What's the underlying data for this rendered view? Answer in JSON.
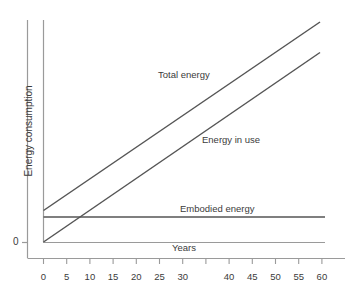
{
  "chart_data": {
    "type": "line",
    "title": "",
    "xlabel": "Years",
    "ylabel": "Energy consumption",
    "xlim": [
      0,
      60
    ],
    "ylim": [
      0,
      100
    ],
    "grid": false,
    "legend_position": "inline-annotations",
    "xticks": [
      0,
      5,
      10,
      15,
      20,
      25,
      30,
      35,
      40,
      45,
      50,
      55,
      60
    ],
    "xtick_labels": [
      "0",
      "5",
      "10",
      "15",
      "20",
      "25",
      "30",
      "",
      "40",
      "45",
      "50",
      "55",
      "60"
    ],
    "yticks": [
      0
    ],
    "ytick_labels": [
      "0"
    ],
    "series": [
      {
        "name": "Total energy",
        "x": [
          0,
          60
        ],
        "values": [
          11.5,
          100.0
        ],
        "annotation": "Total energy",
        "color": "#555555"
      },
      {
        "name": "Energy in use",
        "x": [
          0,
          60
        ],
        "values": [
          0.0,
          88.5
        ],
        "annotation": "Energy in use",
        "color": "#555555"
      },
      {
        "name": "Embodied energy",
        "x": [
          0,
          60
        ],
        "values": [
          11.5,
          11.5
        ],
        "annotation": "Embodied energy",
        "color": "#555555"
      }
    ]
  },
  "axes": {
    "y_axis_title": "Energy consumption",
    "y_zero_label": "0",
    "x_axis_title": "Years"
  },
  "annotations": {
    "total": "Total energy",
    "in_use": "Energy in use",
    "embodied": "Embodied energy"
  },
  "style": {
    "line_color": "#555555",
    "axis_color": "#8a8a8a",
    "text_color": "#3b3b3b",
    "background": "#ffffff"
  }
}
